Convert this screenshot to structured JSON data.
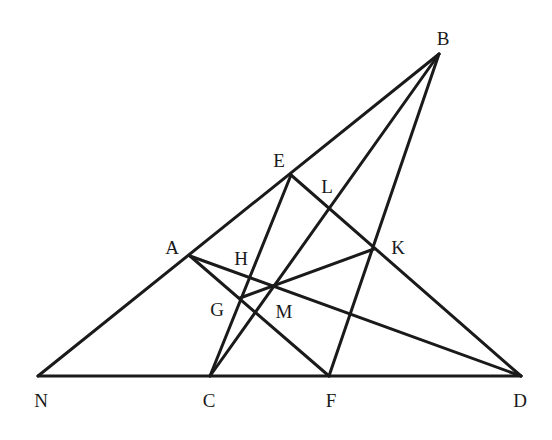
{
  "diagram": {
    "type": "geometric-construction",
    "points": {
      "B": {
        "x": 439,
        "y": 54
      },
      "E": {
        "x": 291,
        "y": 175
      },
      "L": {
        "x": 331,
        "y": 208
      },
      "A": {
        "x": 190,
        "y": 256
      },
      "K": {
        "x": 374,
        "y": 249
      },
      "H": {
        "x": 249,
        "y": 277
      },
      "M": {
        "x": 274,
        "y": 286
      },
      "G": {
        "x": 240,
        "y": 298
      },
      "N": {
        "x": 38,
        "y": 376
      },
      "C": {
        "x": 210,
        "y": 376
      },
      "F": {
        "x": 329,
        "y": 376
      },
      "D": {
        "x": 521,
        "y": 376
      }
    },
    "segments": [
      {
        "from": "N",
        "to": "B",
        "through": [
          "A",
          "E"
        ]
      },
      {
        "from": "N",
        "to": "D",
        "through": [
          "C",
          "F"
        ]
      },
      {
        "from": "E",
        "to": "C",
        "through": [
          "H",
          "G"
        ]
      },
      {
        "from": "E",
        "to": "D",
        "through": [
          "L",
          "K"
        ]
      },
      {
        "from": "B",
        "to": "C",
        "through": [
          "L",
          "M"
        ]
      },
      {
        "from": "B",
        "to": "F",
        "through": [
          "K"
        ]
      },
      {
        "from": "A",
        "to": "D",
        "through": [
          "H",
          "M"
        ]
      },
      {
        "from": "A",
        "to": "F",
        "through": [
          "G"
        ]
      },
      {
        "from": "G",
        "to": "K",
        "through": [
          "M"
        ]
      }
    ],
    "labels": [
      {
        "text": "B",
        "x": 443,
        "y": 38
      },
      {
        "text": "E",
        "x": 279,
        "y": 160
      },
      {
        "text": "L",
        "x": 327,
        "y": 186
      },
      {
        "text": "A",
        "x": 172,
        "y": 247
      },
      {
        "text": "H",
        "x": 241,
        "y": 258
      },
      {
        "text": "K",
        "x": 398,
        "y": 247
      },
      {
        "text": "G",
        "x": 217,
        "y": 309
      },
      {
        "text": "M",
        "x": 284,
        "y": 311
      },
      {
        "text": "N",
        "x": 41,
        "y": 400
      },
      {
        "text": "C",
        "x": 209,
        "y": 400
      },
      {
        "text": "F",
        "x": 331,
        "y": 400
      },
      {
        "text": "D",
        "x": 520,
        "y": 400
      }
    ],
    "line_color": "#1a1a1a"
  }
}
